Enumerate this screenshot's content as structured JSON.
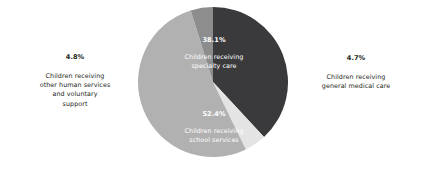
{
  "chart_data": {
    "type": "pie",
    "title": "",
    "subtitle": "",
    "xlabel": "",
    "ylabel": "",
    "legend_position": "none",
    "grid": false,
    "start_angle_deg": 0,
    "direction": "clockwise",
    "categories": [
      "Children receiving specialty care",
      "Children receiving general medical care",
      "Children receiving school services",
      "Children receiving other human services and voluntary support"
    ],
    "values": [
      38.1,
      4.7,
      52.4,
      4.8
    ],
    "value_labels": [
      "38.1%",
      "4.7%",
      "52.4%",
      "4.8%"
    ],
    "colors": [
      "#3a3a3c",
      "#e4e4e4",
      "#b1b1b1",
      "#8d8d8d"
    ],
    "slices": [
      {
        "key": "specialty-care",
        "percent": 38.1,
        "percent_label": "38.1%",
        "description": "Children receiving\nspecialty care",
        "color": "#3a3a3c",
        "label_placement": "inside",
        "label_color": "#ffffff"
      },
      {
        "key": "general-medical-care",
        "percent": 4.7,
        "percent_label": "4.7%",
        "description": "Children receiving\ngeneral medical care",
        "color": "#e4e4e4",
        "label_placement": "outside-right",
        "label_color": "#231f20"
      },
      {
        "key": "school-services",
        "percent": 52.4,
        "percent_label": "52.4%",
        "description": "Children receiving\nschool services",
        "color": "#b1b1b1",
        "label_placement": "inside",
        "label_color": "#ffffff"
      },
      {
        "key": "other-human-services",
        "percent": 4.8,
        "percent_label": "4.8%",
        "description": "Children receiving\nother human services\nand voluntary\nsupport",
        "color": "#8d8d8d",
        "label_placement": "outside-left",
        "label_color": "#231f20"
      }
    ]
  },
  "figure": {
    "background": "#ffffff"
  }
}
